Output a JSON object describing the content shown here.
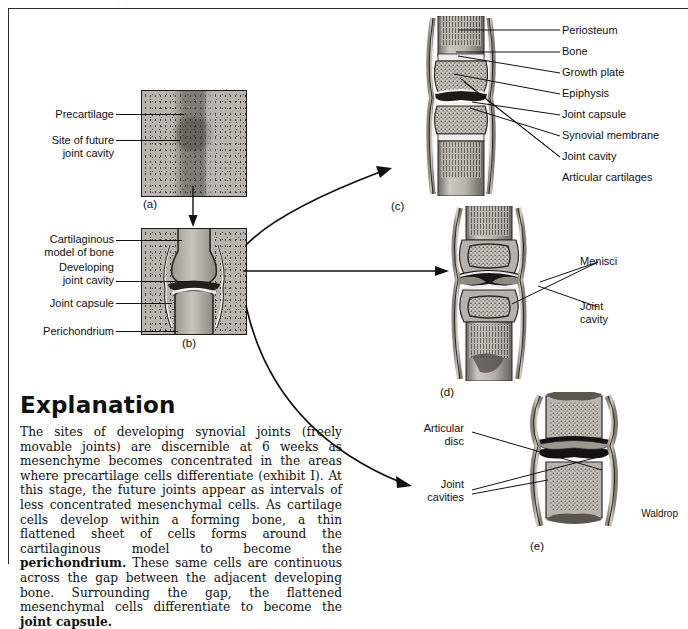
{
  "page": {
    "top_faint_text": "·  ·   ·     ·    ·      ·       ·         ·      ·",
    "credit": "Waldrop"
  },
  "panels": {
    "a": {
      "caption": "(a)",
      "labels": [
        {
          "text": "Precartilage",
          "name": "label-precartilage"
        },
        {
          "text": "Site of future\njoint cavity",
          "name": "label-site-of-future-joint-cavity"
        }
      ]
    },
    "b": {
      "caption": "(b)",
      "labels": [
        {
          "text": "Cartilaginous\nmodel of bone",
          "name": "label-cartilaginous-model-of-bone"
        },
        {
          "text": "Developing\njoint cavity",
          "name": "label-developing-joint-cavity"
        },
        {
          "text": "Joint capsule",
          "name": "label-joint-capsule"
        },
        {
          "text": "Perichondrium",
          "name": "label-perichondrium"
        }
      ]
    },
    "c": {
      "caption": "(c)",
      "labels": [
        {
          "text": "Periosteum",
          "name": "label-periosteum"
        },
        {
          "text": "Bone",
          "name": "label-bone"
        },
        {
          "text": "Growth plate",
          "name": "label-growth-plate"
        },
        {
          "text": "Epiphysis",
          "name": "label-epiphysis"
        },
        {
          "text": "Joint capsule",
          "name": "label-joint-capsule"
        },
        {
          "text": "Synovial membrane",
          "name": "label-synovial-membrane"
        },
        {
          "text": "Joint cavity",
          "name": "label-joint-cavity"
        },
        {
          "text": "Articular cartilages",
          "name": "label-articular-cartilages"
        }
      ]
    },
    "d": {
      "caption": "(d)",
      "labels": [
        {
          "text": "Menisci",
          "name": "label-menisci"
        },
        {
          "text": "Joint\ncavity",
          "name": "label-joint-cavity"
        }
      ]
    },
    "e": {
      "caption": "(e)",
      "labels": [
        {
          "text": "Articular\ndisc",
          "name": "label-articular-disc"
        },
        {
          "text": "Joint\ncavities",
          "name": "label-joint-cavities"
        }
      ]
    }
  },
  "explanation": {
    "heading": "Explanation",
    "body_parts": [
      {
        "type": "text",
        "text": "The sites of developing synovial joints (freely movable joints) are discernible at 6 weeks as mesenchyme becomes concentrated in the areas where precartilage cells differentiate (exhibit I). At this stage, the future joints appear as intervals of less concentrated mesenchymal cells. As cartilage cells develop within a forming bone, a thin flattened sheet of cells forms around the cartilaginous model to become the "
      },
      {
        "type": "bold",
        "text": "perichondrium."
      },
      {
        "type": "text",
        "text": " These same cells are continuous across the gap between the adjacent developing bone. Surrounding the gap, the flattened mesenchymal cells differentiate to become the "
      },
      {
        "type": "bold",
        "text": "joint capsule."
      }
    ]
  }
}
